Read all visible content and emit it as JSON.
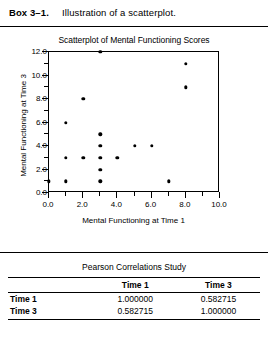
{
  "caption": {
    "label": "Box 3–1.",
    "text": "Illustration of a scatterplot."
  },
  "chart_data": {
    "type": "scatter",
    "title": "Scatterplot of Mental Functioning Scores",
    "xlabel": "Mental Functioning at Time 1",
    "ylabel": "Mental Functioning at Time 3",
    "xlim": [
      0.0,
      10.0
    ],
    "ylim": [
      0.0,
      12.0
    ],
    "xticks": [
      0.0,
      2.0,
      4.0,
      6.0,
      8.0,
      10.0
    ],
    "xtick_labels": [
      "0.0",
      "2.0",
      "4.0",
      "6.0",
      "8.0",
      "10.0"
    ],
    "xminor_ticks": [
      1.0,
      3.0,
      5.0,
      7.0,
      9.0
    ],
    "yticks": [
      0.0,
      2.0,
      4.0,
      6.0,
      8.0,
      10.0,
      12.0
    ],
    "ytick_labels": [
      "0.0",
      "2.0",
      "4.0",
      "6.0",
      "8.0",
      "10.0",
      "12.0"
    ],
    "yminor_ticks": [
      1.0,
      3.0,
      5.0,
      7.0,
      9.0,
      11.0
    ],
    "grid": false,
    "legend": false,
    "marker_color": "#000000",
    "points": [
      {
        "x": 0.0,
        "y": 1.0
      },
      {
        "x": 1.0,
        "y": 1.0
      },
      {
        "x": 1.0,
        "y": 3.0
      },
      {
        "x": 1.0,
        "y": 6.0
      },
      {
        "x": 2.0,
        "y": 3.0
      },
      {
        "x": 2.0,
        "y": 8.0
      },
      {
        "x": 3.0,
        "y": 1.0
      },
      {
        "x": 3.0,
        "y": 2.0
      },
      {
        "x": 3.0,
        "y": 3.0
      },
      {
        "x": 3.0,
        "y": 4.0
      },
      {
        "x": 3.0,
        "y": 5.0
      },
      {
        "x": 3.0,
        "y": 12.0
      },
      {
        "x": 4.0,
        "y": 3.0
      },
      {
        "x": 5.0,
        "y": 4.0
      },
      {
        "x": 6.0,
        "y": 4.0
      },
      {
        "x": 7.0,
        "y": 1.0
      },
      {
        "x": 8.0,
        "y": 9.0
      },
      {
        "x": 8.0,
        "y": 11.0
      }
    ]
  },
  "table": {
    "title": "Pearson Correlations Study",
    "columns": [
      "",
      "Time 1",
      "Time 3"
    ],
    "rows": [
      {
        "header": "Time 1",
        "values": [
          "1.000000",
          "0.582715"
        ]
      },
      {
        "header": "Time 3",
        "values": [
          "0.582715",
          "1.000000"
        ]
      }
    ]
  }
}
